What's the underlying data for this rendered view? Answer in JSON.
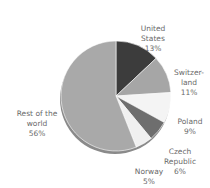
{
  "chart_data": {
    "type": "pie",
    "title": "",
    "categories": [
      "United States",
      "Switzerland",
      "Poland",
      "Czech Republic",
      "Norway",
      "Rest of the world"
    ],
    "values": [
      13,
      11,
      9,
      6,
      5,
      56
    ],
    "unit": "%",
    "colors": [
      "#3c3c3c",
      "#a6a6a6",
      "#f4f4f4",
      "#6e6e6e",
      "#f0f0f0",
      "#a9a9a9"
    ],
    "labels": [
      {
        "name": "United\nStates",
        "pct": "13%"
      },
      {
        "name": "Switzer-\nland",
        "pct": "11%"
      },
      {
        "name": "Poland",
        "pct": "9%"
      },
      {
        "name": "Czech\nRepublic",
        "pct": "6%"
      },
      {
        "name": "Norway",
        "pct": "5%"
      },
      {
        "name": "Rest of the\nworld",
        "pct": "56%"
      }
    ],
    "legend": "none (direct labels)"
  }
}
